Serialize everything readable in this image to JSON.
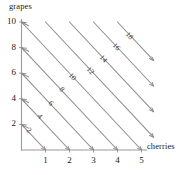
{
  "chart_data": {
    "type": "line",
    "title": "",
    "xlabel": "cherries",
    "ylabel": "grapes",
    "xlim": [
      0,
      5.6
    ],
    "ylim": [
      0,
      10.8
    ],
    "xticks": [
      1,
      2,
      3,
      4,
      5
    ],
    "yticks": [
      2,
      4,
      6,
      8,
      10
    ],
    "grid": false,
    "legend": "none",
    "line_equation": "2*cherries + grapes = C",
    "slope": -2,
    "line_color": "#8c8c8c",
    "axis_color": "#9a9a9a",
    "text_color": "#222222",
    "series": [
      {
        "name": "2",
        "value": 2,
        "label": "2",
        "x": [
          0,
          1
        ],
        "y": [
          2,
          0
        ]
      },
      {
        "name": "4",
        "value": 4,
        "label": "4",
        "x": [
          0,
          2
        ],
        "y": [
          4,
          0
        ]
      },
      {
        "name": "6",
        "value": 6,
        "label": "6",
        "x": [
          0,
          3
        ],
        "y": [
          6,
          0
        ]
      },
      {
        "name": "8",
        "value": 8,
        "label": "8",
        "x": [
          0,
          4
        ],
        "y": [
          8,
          0
        ]
      },
      {
        "name": "10",
        "value": 10,
        "label": "10",
        "x": [
          0,
          5
        ],
        "y": [
          10,
          0
        ]
      },
      {
        "name": "12",
        "value": 12,
        "label": "12",
        "x": [
          1,
          5.5
        ],
        "y": [
          10,
          1
        ]
      },
      {
        "name": "14",
        "value": 14,
        "label": "14",
        "x": [
          2,
          5.5
        ],
        "y": [
          10,
          3
        ]
      },
      {
        "name": "16",
        "value": 16,
        "label": "16",
        "x": [
          3,
          5.5
        ],
        "y": [
          10,
          5
        ]
      },
      {
        "name": "18",
        "value": 18,
        "label": "18",
        "x": [
          4,
          5.5
        ],
        "y": [
          10,
          7
        ]
      }
    ]
  },
  "axes": {
    "x_title": "cherries",
    "y_title": "grapes",
    "x_tick_labels": [
      "1",
      "2",
      "3",
      "4",
      "5"
    ],
    "y_tick_labels": [
      "2",
      "4",
      "6",
      "8",
      "10"
    ]
  },
  "contour_labels": [
    "2",
    "4",
    "6",
    "8",
    "10",
    "12",
    "14",
    "16",
    "18"
  ]
}
